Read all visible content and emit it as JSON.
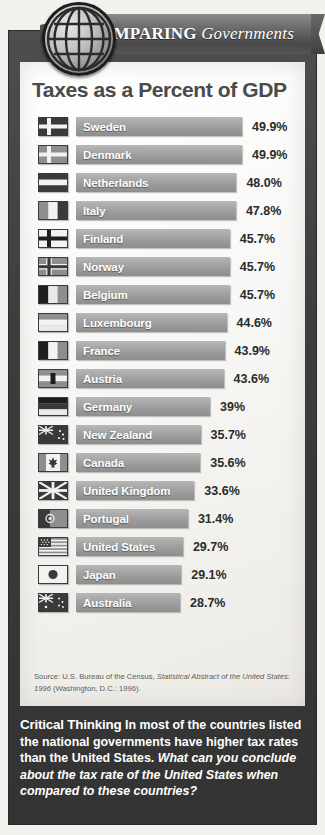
{
  "banner": {
    "word1": "COMPARING",
    "word2": "Governments",
    "globe_icon": "globe-icon"
  },
  "chart_title": "Taxes as a Percent of GDP",
  "chart_data": {
    "type": "bar",
    "title": "Taxes as a Percent of GDP",
    "xlabel": "",
    "ylabel": "",
    "orientation": "horizontal",
    "grid": false,
    "legend": false,
    "value_suffix": "%",
    "categories": [
      "Sweden",
      "Denmark",
      "Netherlands",
      "Italy",
      "Finland",
      "Norway",
      "Belgium",
      "Luxembourg",
      "France",
      "Austria",
      "Germany",
      "New Zealand",
      "Canada",
      "United Kingdom",
      "Portugal",
      "United States",
      "Japan",
      "Australia"
    ],
    "values": [
      49.9,
      49.9,
      48.0,
      47.8,
      45.7,
      45.7,
      45.7,
      44.6,
      43.9,
      43.6,
      39,
      35.7,
      35.6,
      33.6,
      31.4,
      29.7,
      29.1,
      28.7
    ],
    "value_labels": [
      "49.9%",
      "49.9%",
      "48.0%",
      "47.8%",
      "45.7%",
      "45.7%",
      "45.7%",
      "44.6%",
      "43.9%",
      "43.6%",
      "39%",
      "35.7%",
      "35.6%",
      "33.6%",
      "31.4%",
      "29.7%",
      "29.1%",
      "28.7%"
    ],
    "rows": [
      {
        "country": "Sweden",
        "value": 49.9,
        "label": "49.9%",
        "flag": "flag-sweden"
      },
      {
        "country": "Denmark",
        "value": 49.9,
        "label": "49.9%",
        "flag": "flag-denmark"
      },
      {
        "country": "Netherlands",
        "value": 48.0,
        "label": "48.0%",
        "flag": "flag-netherlands"
      },
      {
        "country": "Italy",
        "value": 47.8,
        "label": "47.8%",
        "flag": "flag-italy"
      },
      {
        "country": "Finland",
        "value": 45.7,
        "label": "45.7%",
        "flag": "flag-finland"
      },
      {
        "country": "Norway",
        "value": 45.7,
        "label": "45.7%",
        "flag": "flag-norway"
      },
      {
        "country": "Belgium",
        "value": 45.7,
        "label": "45.7%",
        "flag": "flag-belgium"
      },
      {
        "country": "Luxembourg",
        "value": 44.6,
        "label": "44.6%",
        "flag": "flag-luxembourg"
      },
      {
        "country": "France",
        "value": 43.9,
        "label": "43.9%",
        "flag": "flag-france"
      },
      {
        "country": "Austria",
        "value": 43.6,
        "label": "43.6%",
        "flag": "flag-austria"
      },
      {
        "country": "Germany",
        "value": 39,
        "label": "39%",
        "flag": "flag-germany"
      },
      {
        "country": "New Zealand",
        "value": 35.7,
        "label": "35.7%",
        "flag": "flag-new-zealand"
      },
      {
        "country": "Canada",
        "value": 35.6,
        "label": "35.6%",
        "flag": "flag-canada"
      },
      {
        "country": "United Kingdom",
        "value": 33.6,
        "label": "33.6%",
        "flag": "flag-united-kingdom"
      },
      {
        "country": "Portugal",
        "value": 31.4,
        "label": "31.4%",
        "flag": "flag-portugal"
      },
      {
        "country": "United States",
        "value": 29.7,
        "label": "29.7%",
        "flag": "flag-united-states"
      },
      {
        "country": "Japan",
        "value": 29.1,
        "label": "29.1%",
        "flag": "flag-japan"
      },
      {
        "country": "Australia",
        "value": 28.7,
        "label": "28.7%",
        "flag": "flag-australia"
      }
    ]
  },
  "source": {
    "prefix": "Source: U.S. Bureau of the Census, ",
    "italic": "Statistical Abstract of the United States: 1996",
    "suffix": " (Washington, D.C.: 1996)."
  },
  "critical_thinking": {
    "lead": "Critical Thinking",
    "statement": "In most of the countries listed the national governments have higher tax rates than the United States.",
    "question": "What can you conclude about the tax rate of the United States when compared to these countries?"
  },
  "colors": {
    "frame": "#3c3c3c",
    "card": "#f7f7f5",
    "bar": "#9d9d9d",
    "title": "#4a4a4a",
    "value_text": "#2b2b2b",
    "banner": "#5a5a5a"
  }
}
